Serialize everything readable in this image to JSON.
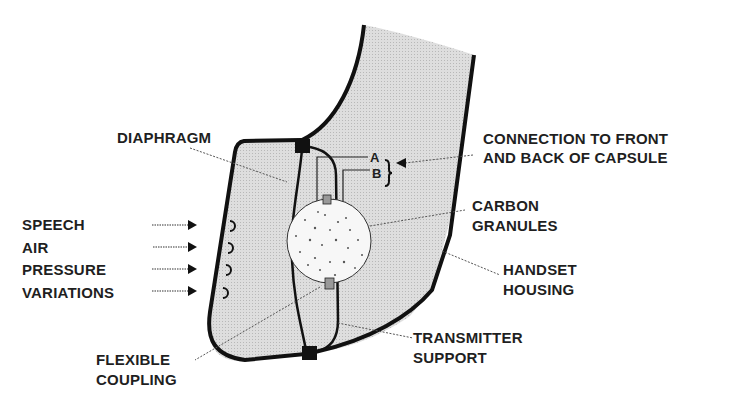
{
  "colors": {
    "outline": "#111111",
    "housing_fill": "#d9d9d9",
    "granules_fill": "#f5f5f5",
    "leader_line": "#555555",
    "text": "#1f1f1f"
  },
  "labels": {
    "diaphragm": "DIAPHRAGM",
    "connection": [
      "CONNECTION TO FRONT",
      "AND BACK OF CAPSULE"
    ],
    "terminal_a": "A",
    "terminal_b": "B",
    "carbon_granules": [
      "CARBON",
      "GRANULES"
    ],
    "handset_housing": [
      "HANDSET",
      "HOUSING"
    ],
    "transmitter_support": [
      "TRANSMITTER",
      "SUPPORT"
    ],
    "flexible_coupling": [
      "FLEXIBLE",
      "COUPLING"
    ],
    "speech_input": [
      "SPEECH",
      "AIR",
      "PRESSURE",
      "VARIATIONS"
    ]
  },
  "components": [
    "handset-housing",
    "diaphragm",
    "carbon-granule-capsule",
    "flexible-coupling",
    "transmitter-support",
    "terminal-A",
    "terminal-B",
    "mouthpiece-openings"
  ],
  "arrows": {
    "speech_arrows": 4,
    "connection_arrow": "points-left-to-A-B-bracket"
  }
}
